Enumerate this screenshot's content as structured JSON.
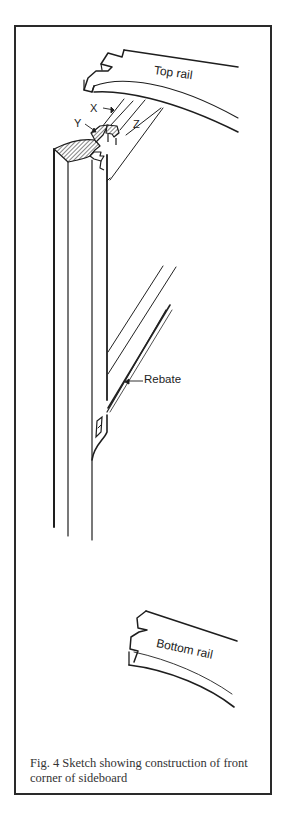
{
  "figure": {
    "labels": {
      "top_rail": "Top rail",
      "bottom_rail": "Bottom rail",
      "rebate": "Rebate",
      "x": "X",
      "y": "Y",
      "z": "Z"
    },
    "caption": {
      "line1": "Fig. 4  Sketch showing construction of front",
      "line2": "corner of sideboard"
    },
    "colors": {
      "ink": "#222222",
      "frame": "#2a2a2a",
      "background": "#ffffff"
    }
  }
}
